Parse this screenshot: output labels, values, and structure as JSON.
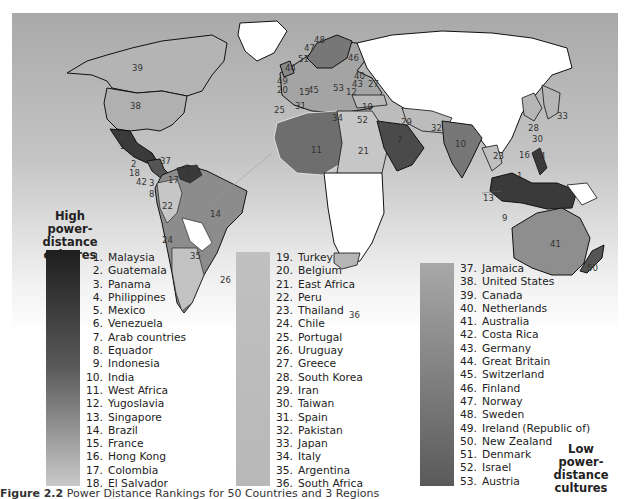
{
  "figure": {
    "caption_label": "Figure 2.2",
    "caption_text": "Power Distance Rankings for 50 Countries and 3 Regions"
  },
  "legend": {
    "high_title": [
      "High",
      "power-distance",
      "cultures"
    ],
    "low_title": [
      "Low",
      "power-distance",
      "cultures"
    ],
    "bar_colors": {
      "col1_top": "#1e1e1e",
      "col1_bottom": "#c9c9c9",
      "col2": "#bdbdbd",
      "col3_top": "#a6a6a6",
      "col3_bottom": "#555555"
    },
    "columns": [
      [
        {
          "n": "1.",
          "name": "Malaysia"
        },
        {
          "n": "2.",
          "name": "Guatemala"
        },
        {
          "n": "3.",
          "name": "Panama"
        },
        {
          "n": "4.",
          "name": "Philippines"
        },
        {
          "n": "5.",
          "name": "Mexico"
        },
        {
          "n": "6.",
          "name": "Venezuela"
        },
        {
          "n": "7.",
          "name": "Arab countries"
        },
        {
          "n": "8.",
          "name": "Equador"
        },
        {
          "n": "9.",
          "name": "Indonesia"
        },
        {
          "n": "10.",
          "name": "India"
        },
        {
          "n": "11.",
          "name": "West Africa"
        },
        {
          "n": "12.",
          "name": "Yugoslavia"
        },
        {
          "n": "13.",
          "name": "Singapore"
        },
        {
          "n": "14.",
          "name": "Brazil"
        },
        {
          "n": "15.",
          "name": "France"
        },
        {
          "n": "16.",
          "name": "Hong Kong"
        },
        {
          "n": "17.",
          "name": "Colombia"
        },
        {
          "n": "18.",
          "name": "El Salvador"
        }
      ],
      [
        {
          "n": "19.",
          "name": "Turkey"
        },
        {
          "n": "20.",
          "name": "Belgium"
        },
        {
          "n": "21.",
          "name": "East Africa"
        },
        {
          "n": "22.",
          "name": "Peru"
        },
        {
          "n": "23.",
          "name": "Thailand"
        },
        {
          "n": "24.",
          "name": "Chile"
        },
        {
          "n": "25.",
          "name": "Portugal"
        },
        {
          "n": "26.",
          "name": "Uruguay"
        },
        {
          "n": "27.",
          "name": "Greece"
        },
        {
          "n": "28.",
          "name": "South Korea"
        },
        {
          "n": "29.",
          "name": "Iran"
        },
        {
          "n": "30.",
          "name": "Taiwan"
        },
        {
          "n": "31.",
          "name": "Spain"
        },
        {
          "n": "32.",
          "name": "Pakistan"
        },
        {
          "n": "33.",
          "name": "Japan"
        },
        {
          "n": "34.",
          "name": "Italy"
        },
        {
          "n": "35.",
          "name": "Argentina"
        },
        {
          "n": "36.",
          "name": "South Africa"
        }
      ],
      [
        {
          "n": "37.",
          "name": "Jamaica"
        },
        {
          "n": "38.",
          "name": "United States"
        },
        {
          "n": "39.",
          "name": "Canada"
        },
        {
          "n": "40.",
          "name": "Netherlands"
        },
        {
          "n": "41.",
          "name": "Australia"
        },
        {
          "n": "42.",
          "name": "Costa Rica"
        },
        {
          "n": "43.",
          "name": "Germany"
        },
        {
          "n": "44.",
          "name": "Great Britain"
        },
        {
          "n": "45.",
          "name": "Switzerland"
        },
        {
          "n": "46.",
          "name": "Finland"
        },
        {
          "n": "47.",
          "name": "Norway"
        },
        {
          "n": "48.",
          "name": "Sweden"
        },
        {
          "n": "49.",
          "name": "Ireland (Republic of)"
        },
        {
          "n": "50.",
          "name": "New Zealand"
        },
        {
          "n": "51.",
          "name": "Denmark"
        },
        {
          "n": "52.",
          "name": "Israel"
        },
        {
          "n": "53.",
          "name": "Austria"
        }
      ]
    ]
  },
  "map": {
    "labels": [
      {
        "t": "39",
        "x": 120,
        "y": 50
      },
      {
        "t": "38",
        "x": 118,
        "y": 88
      },
      {
        "t": "5",
        "x": 108,
        "y": 128
      },
      {
        "t": "37",
        "x": 148,
        "y": 143
      },
      {
        "t": "2",
        "x": 119,
        "y": 146
      },
      {
        "t": "18",
        "x": 117,
        "y": 155
      },
      {
        "t": "42",
        "x": 124,
        "y": 164
      },
      {
        "t": "3",
        "x": 137,
        "y": 165
      },
      {
        "t": "17",
        "x": 156,
        "y": 162
      },
      {
        "t": "6",
        "x": 173,
        "y": 155
      },
      {
        "t": "8",
        "x": 137,
        "y": 176
      },
      {
        "t": "22",
        "x": 150,
        "y": 188
      },
      {
        "t": "14",
        "x": 198,
        "y": 196
      },
      {
        "t": "24",
        "x": 150,
        "y": 222
      },
      {
        "t": "35",
        "x": 178,
        "y": 238
      },
      {
        "t": "26",
        "x": 208,
        "y": 262
      },
      {
        "t": "48",
        "x": 302,
        "y": 22
      },
      {
        "t": "47",
        "x": 292,
        "y": 30
      },
      {
        "t": "51",
        "x": 286,
        "y": 41
      },
      {
        "t": "46",
        "x": 336,
        "y": 40
      },
      {
        "t": "44",
        "x": 273,
        "y": 50
      },
      {
        "t": "40",
        "x": 342,
        "y": 58
      },
      {
        "t": "49",
        "x": 265,
        "y": 63
      },
      {
        "t": "43",
        "x": 340,
        "y": 66
      },
      {
        "t": "27",
        "x": 356,
        "y": 66
      },
      {
        "t": "20",
        "x": 265,
        "y": 72
      },
      {
        "t": "15",
        "x": 287,
        "y": 74
      },
      {
        "t": "45",
        "x": 296,
        "y": 72
      },
      {
        "t": "53",
        "x": 321,
        "y": 70
      },
      {
        "t": "12",
        "x": 334,
        "y": 74
      },
      {
        "t": "31",
        "x": 283,
        "y": 88
      },
      {
        "t": "25",
        "x": 262,
        "y": 92
      },
      {
        "t": "19",
        "x": 350,
        "y": 89
      },
      {
        "t": "34",
        "x": 320,
        "y": 100
      },
      {
        "t": "52",
        "x": 345,
        "y": 102
      },
      {
        "t": "29",
        "x": 389,
        "y": 104
      },
      {
        "t": "32",
        "x": 419,
        "y": 110
      },
      {
        "t": "7",
        "x": 385,
        "y": 122
      },
      {
        "t": "10",
        "x": 443,
        "y": 126
      },
      {
        "t": "11",
        "x": 299,
        "y": 132
      },
      {
        "t": "21",
        "x": 346,
        "y": 133
      },
      {
        "t": "28",
        "x": 516,
        "y": 110
      },
      {
        "t": "33",
        "x": 545,
        "y": 98
      },
      {
        "t": "30",
        "x": 520,
        "y": 121
      },
      {
        "t": "16",
        "x": 507,
        "y": 137
      },
      {
        "t": "4",
        "x": 528,
        "y": 138
      },
      {
        "t": "23",
        "x": 481,
        "y": 138
      },
      {
        "t": "1",
        "x": 505,
        "y": 158
      },
      {
        "t": "13",
        "x": 471,
        "y": 180
      },
      {
        "t": "9",
        "x": 490,
        "y": 200
      },
      {
        "t": "41",
        "x": 538,
        "y": 226
      },
      {
        "t": "36",
        "x": 337,
        "y": 297
      },
      {
        "t": "50",
        "x": 575,
        "y": 250
      }
    ]
  }
}
